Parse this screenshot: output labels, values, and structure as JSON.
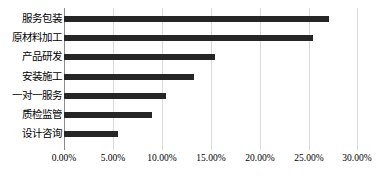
{
  "chart_data": {
    "type": "bar",
    "orientation": "horizontal",
    "title": "",
    "subtitle": "",
    "xlabel": "",
    "ylabel": "",
    "categories": [
      "服务包装",
      "原材料加工",
      "产品研发",
      "安装施工",
      "一对一服务",
      "质检监管",
      "设计咨询"
    ],
    "values": [
      27.0,
      25.4,
      15.4,
      13.3,
      10.4,
      9.0,
      5.5
    ],
    "value_format": "percent",
    "xlim": [
      0,
      30
    ],
    "xticks": [
      0,
      5,
      10,
      15,
      20,
      25,
      30
    ],
    "xtick_labels": [
      "0.00%",
      "5.00%",
      "10.00%",
      "15.00%",
      "20.00%",
      "25.00%",
      "30.00%"
    ],
    "grid": {
      "vertical": true,
      "horizontal": false
    },
    "legend": {
      "show": false,
      "position": "none"
    },
    "series": [
      {
        "name": "占比",
        "values": [
          27.0,
          25.4,
          15.4,
          13.3,
          10.4,
          9.0,
          5.5
        ]
      }
    ]
  },
  "colors": {
    "bar": "#262626",
    "gridline": "#d9d9d9",
    "axis": "#8c8c8c",
    "background": "#ffffff",
    "text": "#000000"
  }
}
